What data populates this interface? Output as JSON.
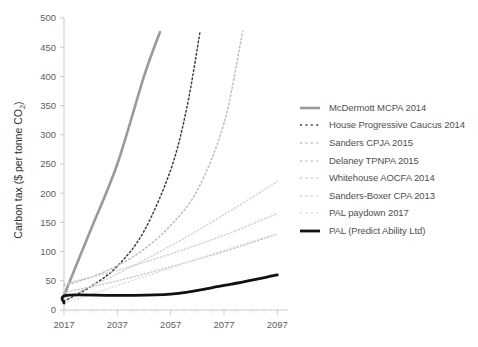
{
  "chart_data": {
    "type": "line",
    "title": "",
    "xlabel": "",
    "ylabel": "Carbon tax ($ per tonne CO2)",
    "ylabel_main": "Carbon tax ($ per tonne CO",
    "ylabel_sub": "2",
    "ylabel_close": ")",
    "xlim": [
      2017,
      2101
    ],
    "ylim": [
      0,
      500
    ],
    "grid": false,
    "legend_position": "right",
    "yticks": [
      0,
      50,
      100,
      150,
      200,
      250,
      300,
      350,
      400,
      450,
      500
    ],
    "ytick_labels": [
      "0",
      "50",
      "100",
      "150",
      "200",
      "250",
      "300",
      "350",
      "400",
      "450",
      "500"
    ],
    "xticks": [
      2017,
      2037,
      2057,
      2077,
      2097
    ],
    "xtick_labels": [
      "2017",
      "2037",
      "2057",
      "2077",
      "2097"
    ],
    "xticks_minor": [
      2022,
      2027,
      2032,
      2042,
      2047,
      2052,
      2062,
      2067,
      2072,
      2082,
      2087,
      2092
    ],
    "series": [
      {
        "name": "McDermott MCPA 2014",
        "style": "solid",
        "color": "#9a9a9a",
        "width": 2.6,
        "x": [
          2017,
          2027,
          2037,
          2047,
          2053
        ],
        "values": [
          25,
          137,
          250,
          400,
          476
        ]
      },
      {
        "name": "House Progressive Caucus 2014",
        "style": "dotted",
        "color": "#3d3d3d",
        "width": 1.5,
        "x": [
          2017,
          2027,
          2037,
          2047,
          2057,
          2063,
          2068
        ],
        "values": [
          15,
          40,
          75,
          135,
          240,
          345,
          476
        ]
      },
      {
        "name": "Sanders CPJA 2015",
        "style": "dotted",
        "color": "#bdbdbd",
        "width": 1.5,
        "x": [
          2017,
          2027,
          2037,
          2047,
          2057,
          2067,
          2077,
          2084
        ],
        "values": [
          42,
          56,
          76,
          104,
          145,
          205,
          320,
          477
        ]
      },
      {
        "name": "Delaney TPNPA 2015",
        "style": "dotted",
        "color": "#c6c6c6",
        "width": 1.3,
        "x": [
          2017,
          2037,
          2057,
          2077,
          2097
        ],
        "values": [
          30,
          50,
          74,
          100,
          130
        ]
      },
      {
        "name": "Whitehouse AOCFA 2014",
        "style": "dotted",
        "color": "#cdcdcd",
        "width": 1.3,
        "x": [
          2017,
          2037,
          2057,
          2077,
          2097
        ],
        "values": [
          45,
          68,
          96,
          128,
          165
        ]
      },
      {
        "name": "Sanders-Boxer CPA 2013",
        "style": "dotted",
        "color": "#d0d0d0",
        "width": 1.3,
        "x": [
          2017,
          2037,
          2057,
          2077,
          2097
        ],
        "values": [
          20,
          62,
          110,
          163,
          220
        ]
      },
      {
        "name": "PAL paydown 2017",
        "style": "dotted",
        "color": "#dcdcdc",
        "width": 1.3,
        "x": [
          2017,
          2037,
          2057,
          2077,
          2097
        ],
        "values": [
          12,
          42,
          72,
          102,
          131
        ]
      },
      {
        "name": "PAL (Predict Ability Ltd)",
        "style": "solid",
        "color": "#111111",
        "width": 2.8,
        "x": [
          2017,
          2018,
          2037,
          2057,
          2077,
          2097
        ],
        "values": [
          12,
          25,
          25,
          27,
          42,
          60
        ]
      }
    ]
  },
  "legend": {
    "entries": [
      {
        "label": "McDermott MCPA 2014"
      },
      {
        "label": "House Progressive Caucus 2014"
      },
      {
        "label": "Sanders CPJA 2015"
      },
      {
        "label": "Delaney TPNPA 2015"
      },
      {
        "label": "Whitehouse AOCFA 2014"
      },
      {
        "label": "Sanders-Boxer CPA 2013"
      },
      {
        "label": "PAL paydown 2017"
      },
      {
        "label": "PAL (Predict Ability Ltd)"
      }
    ]
  }
}
